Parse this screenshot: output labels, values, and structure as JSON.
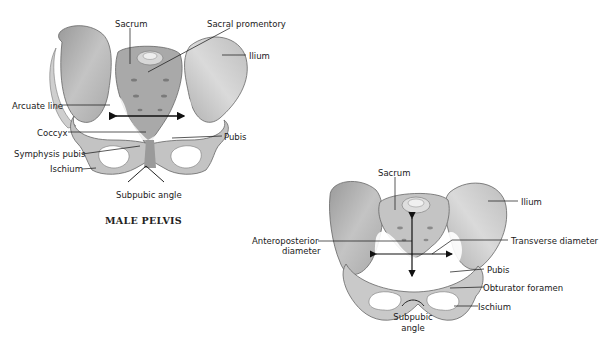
{
  "male": {
    "caption": "MALE PELVIS",
    "labels": {
      "sacrum": "Sacrum",
      "sacral_promontory": "Sacral promentory",
      "ilium": "Ilium",
      "arcuate_line": "Arcuate line",
      "coccyx": "Coccyx",
      "pubis": "Pubis",
      "symphysis_pubis": "Symphysis pubis",
      "ischium": "Ischium",
      "subpubic_angle": "Subpubic angle"
    }
  },
  "female": {
    "labels": {
      "sacrum": "Sacrum",
      "ilium": "Ilium",
      "anteroposterior_1": "Anteroposterior",
      "anteroposterior_2": "diameter",
      "transverse_diameter": "Transverse diameter",
      "pubis": "Pubis",
      "obturator_foramen": "Obturator foramen",
      "ischium": "Ischium",
      "subpubic_1": "Subpubic",
      "subpubic_2": "angle"
    }
  },
  "colors": {
    "bone_light": "#d9d9d9",
    "bone_mid": "#b5b5b5",
    "bone_dark": "#8c8c8c",
    "outline": "#555555",
    "leader": "#111111"
  }
}
